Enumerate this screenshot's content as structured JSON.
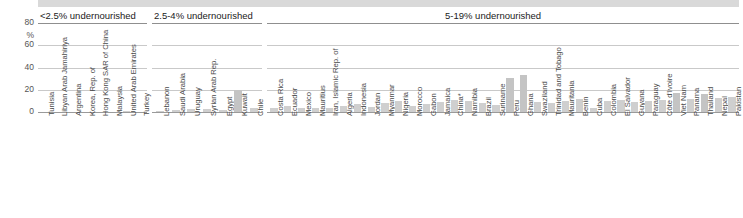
{
  "chart_data": {
    "type": "bar",
    "title": "",
    "subtitle": "",
    "xlabel": "",
    "ylabel": "%",
    "ylim": [
      0,
      80
    ],
    "yticks": [
      0,
      20,
      40,
      60,
      80
    ],
    "ytick_labels": [
      "0",
      "20",
      "40",
      "60",
      "80"
    ],
    "grid": true,
    "legend": "none",
    "bar_color": "#cfcfcf",
    "groups": [
      {
        "label": "<2.5% undernourished",
        "categories": [
          "Tunisia",
          "Libyan Arab Jamahiriya",
          "Argentina",
          "Korea, Rep. of",
          "Hong Kong SAR of China",
          "Malaysia",
          "United Arab Emirates",
          "Turkey"
        ],
        "values": [
          0,
          0,
          0,
          0,
          0,
          0,
          1.2,
          0
        ]
      },
      {
        "label": "2.5-4% undernourished",
        "categories": [
          "Lebanon",
          "Saudi Arabia",
          "Uruguay",
          "Syrian Arab Rep.",
          "Egypt",
          "Kuwait",
          "Chile"
        ],
        "values": [
          1.0,
          2.2,
          2.6,
          2.4,
          1.8,
          20.0,
          3.6
        ]
      },
      {
        "label": "5-19% undernourished",
        "categories": [
          "Costa Rica",
          "Ecuador",
          "Mexico",
          "Mauritius",
          "Iran, Islamic Rep. of",
          "Algeria",
          "Indonesia",
          "Jordan",
          "Myanmar",
          "Nigeria",
          "Morocco",
          "Gabon",
          "Jamaica",
          "China*",
          "Namibia",
          "Brazil",
          "Suriname",
          "Peru",
          "Ghana",
          "Swaziland",
          "Trinidad and Tobago",
          "Mauritania",
          "Benin",
          "Cuba",
          "Colombia",
          "El Salvador",
          "Guyana",
          "Paraguay",
          "Côte d'Ivoire",
          "Viet Nam",
          "Panama",
          "Thailand",
          "Nepal",
          "Pakistan"
        ],
        "values": [
          3.5,
          5.5,
          3.5,
          4.0,
          3.2,
          5.0,
          7.5,
          4.5,
          8.0,
          10.0,
          5.5,
          7.0,
          9.0,
          10.5,
          9.5,
          8.0,
          6.5,
          30.5,
          33.0,
          9.0,
          8.0,
          9.5,
          11.5,
          3.5,
          10.0,
          11.0,
          9.0,
          10.0,
          10.5,
          17.0,
          12.0,
          16.0,
          12.5,
          13.5
        ]
      }
    ]
  }
}
